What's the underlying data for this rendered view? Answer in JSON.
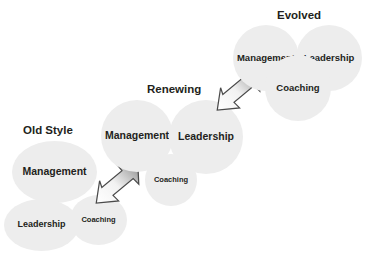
{
  "diagram": {
    "title_text": "",
    "palette": {
      "circle_fill": "#ededed",
      "text_color": "#231f20",
      "arrow_fill_light": "#ffffff",
      "arrow_fill_dark": "#8a8a8a",
      "arrow_stroke": "#4d4d4d",
      "background": "#ffffff"
    },
    "stages": [
      {
        "id": "old-style",
        "title": "Old Style",
        "bubbles": [
          {
            "id": "management",
            "label": "Management",
            "emphasis": "large"
          },
          {
            "id": "leadership",
            "label": "Leadership",
            "emphasis": "medium"
          },
          {
            "id": "coaching",
            "label": "Coaching",
            "emphasis": "small"
          }
        ]
      },
      {
        "id": "renewing",
        "title": "Renewing",
        "bubbles": [
          {
            "id": "management",
            "label": "Management",
            "emphasis": "large"
          },
          {
            "id": "leadership",
            "label": "Leadership",
            "emphasis": "large"
          },
          {
            "id": "coaching",
            "label": "Coaching",
            "emphasis": "small"
          }
        ]
      },
      {
        "id": "evolved",
        "title": "Evolved",
        "bubbles": [
          {
            "id": "management",
            "label": "Management",
            "emphasis": "equal"
          },
          {
            "id": "leadership",
            "label": "Leadership",
            "emphasis": "equal"
          },
          {
            "id": "coaching",
            "label": "Coaching",
            "emphasis": "equal"
          }
        ]
      }
    ],
    "arrows": [
      {
        "id": "arrow-old-to-renewing",
        "direction": "up-right",
        "from": "old-style",
        "to": "renewing"
      },
      {
        "id": "arrow-renewing-to-evolved",
        "direction": "up-right",
        "from": "renewing",
        "to": "evolved"
      }
    ]
  }
}
